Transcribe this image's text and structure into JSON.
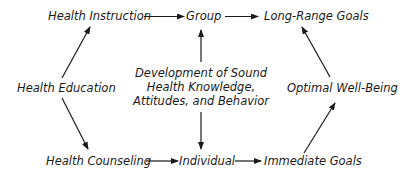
{
  "diagram": {
    "type": "flow",
    "nodes": {
      "health_instruction": "Health Instruction",
      "group": "Group",
      "long_range_goals": "Long-Range Goals",
      "health_education": "Health Education",
      "development": {
        "line1": "Development of Sound",
        "line2": "Health Knowledge,",
        "line3": "Attitudes, and Behavior"
      },
      "optimal_well_being": "Optimal Well-Being",
      "health_counseling": "Health Counseling",
      "individual": "Individual",
      "immediate_goals": "Immediate Goals"
    },
    "edges": [
      {
        "from": "Health Education",
        "to": "Health Instruction"
      },
      {
        "from": "Health Education",
        "to": "Health Counseling"
      },
      {
        "from": "Health Instruction",
        "to": "Group"
      },
      {
        "from": "Group",
        "to": "Long-Range Goals"
      },
      {
        "from": "Development of Sound Health Knowledge, Attitudes, and Behavior",
        "to": "Group"
      },
      {
        "from": "Development of Sound Health Knowledge, Attitudes, and Behavior",
        "to": "Individual"
      },
      {
        "from": "Health Counseling",
        "to": "Individual"
      },
      {
        "from": "Individual",
        "to": "Immediate Goals"
      },
      {
        "from": "Immediate Goals",
        "to": "Optimal Well-Being"
      },
      {
        "from": "Optimal Well-Being",
        "to": "Long-Range Goals"
      }
    ],
    "colors": {
      "text": "#1a1a1a",
      "arrow": "#1a1a1a",
      "background": "#ffffff"
    }
  }
}
